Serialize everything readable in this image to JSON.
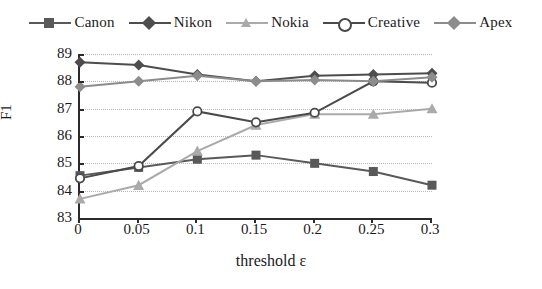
{
  "chart_data": {
    "type": "line",
    "title": "",
    "xlabel": "threshold ε",
    "ylabel": "F1",
    "x": [
      0,
      0.05,
      0.1,
      0.15,
      0.2,
      0.25,
      0.3
    ],
    "xtick_labels": [
      "0",
      "0.05",
      "0.1",
      "0.15",
      "0.2",
      "0.25",
      "0.3"
    ],
    "ytick_labels": [
      "89",
      "88",
      "87",
      "86",
      "85",
      "84",
      "83"
    ],
    "ylim": [
      83,
      89
    ],
    "grid": true,
    "legend_position": "top-center",
    "series": [
      {
        "name": "Canon",
        "marker": "square",
        "color": "#595959",
        "values": [
          84.55,
          84.85,
          85.15,
          85.3,
          85.0,
          84.7,
          84.2
        ]
      },
      {
        "name": "Nikon",
        "marker": "diamond",
        "color": "#4d4d4d",
        "values": [
          88.7,
          88.6,
          88.25,
          88.0,
          88.2,
          88.25,
          88.3
        ]
      },
      {
        "name": "Nokia",
        "marker": "triangle",
        "color": "#aaaaaa",
        "values": [
          83.7,
          84.2,
          85.45,
          86.4,
          86.8,
          86.8,
          87.0
        ]
      },
      {
        "name": "Creative",
        "marker": "circle-open",
        "color": "#4a4a4a",
        "values": [
          84.45,
          84.9,
          86.9,
          86.5,
          86.85,
          88.0,
          87.95
        ]
      },
      {
        "name": "Apex",
        "marker": "diamond",
        "color": "#8c8c8c",
        "values": [
          87.8,
          88.0,
          88.2,
          88.0,
          88.05,
          88.0,
          88.15
        ]
      }
    ]
  },
  "legend": {
    "items": [
      {
        "label": "Canon"
      },
      {
        "label": "Nikon"
      },
      {
        "label": "Nokia"
      },
      {
        "label": "Creative"
      },
      {
        "label": "Apex"
      }
    ]
  },
  "axes": {
    "y_title": "F1",
    "x_title": "threshold ε"
  }
}
